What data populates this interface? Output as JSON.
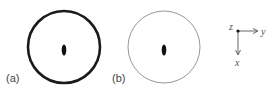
{
  "panels": [
    {
      "label": "(a)",
      "circle": {
        "cx": 64,
        "cy": 47,
        "r": 36,
        "stroke": "#1a1a1a",
        "stroke_width": 2.6
      },
      "dot": {
        "cx": 64,
        "cy": 50,
        "rx": 2.3,
        "ry": 5.5,
        "fill": "#111111"
      }
    },
    {
      "label": "(b)",
      "circle": {
        "cx": 164,
        "cy": 47,
        "r": 36,
        "stroke": "#8a8a8a",
        "stroke_width": 0.9
      },
      "dot": {
        "cx": 164,
        "cy": 50,
        "rx": 2.3,
        "ry": 5.5,
        "fill": "#111111"
      }
    }
  ],
  "axes": {
    "origin_label": "z",
    "horizontal_label": "y",
    "vertical_label": "x"
  }
}
